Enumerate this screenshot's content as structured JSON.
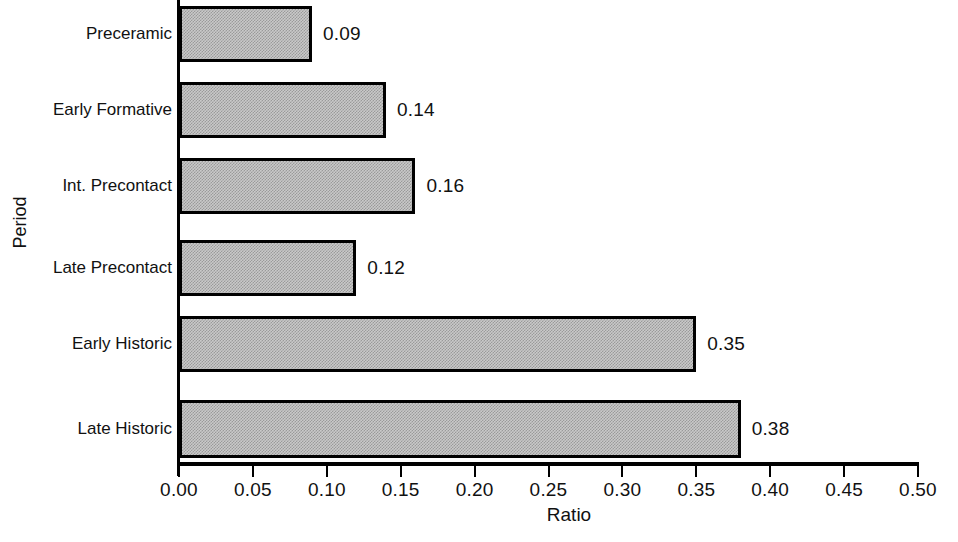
{
  "chart_data": {
    "type": "bar",
    "orientation": "horizontal",
    "title": "",
    "xlabel": "Ratio",
    "ylabel": "Period",
    "categories": [
      "Preceramic",
      "Early Formative",
      "Int. Precontact",
      "Late Precontact",
      "Early Historic",
      "Late Historic"
    ],
    "values": [
      0.09,
      0.14,
      0.16,
      0.12,
      0.35,
      0.38
    ],
    "value_labels": [
      "0.09",
      "0.14",
      "0.16",
      "0.12",
      "0.35",
      "0.38"
    ],
    "xlim": [
      0.0,
      0.5
    ],
    "xticks": [
      0.0,
      0.05,
      0.1,
      0.15,
      0.2,
      0.25,
      0.3,
      0.35,
      0.4,
      0.45,
      0.5
    ],
    "xtick_labels": [
      "0.00",
      "0.05",
      "0.10",
      "0.15",
      "0.20",
      "0.25",
      "0.30",
      "0.35",
      "0.40",
      "0.45",
      "0.50"
    ],
    "grid": false,
    "legend": false,
    "bar_fill_color": "#c9c9c9",
    "bar_edge_color": "#000000",
    "axis_color": "#000000",
    "background_color": "#ffffff"
  },
  "bars": [
    {
      "label": "Preceramic",
      "value_label": "0.09",
      "value": 0.09,
      "top": 6,
      "height": 56
    },
    {
      "label": "Early Formative",
      "value_label": "0.14",
      "value": 0.14,
      "top": 82,
      "height": 56
    },
    {
      "label": "Int. Precontact",
      "value_label": "0.16",
      "value": 0.16,
      "top": 158,
      "height": 56
    },
    {
      "label": "Late Precontact",
      "value_label": "0.12",
      "value": 0.12,
      "top": 240,
      "height": 56
    },
    {
      "label": "Early Historic",
      "value_label": "0.35",
      "value": 0.35,
      "top": 316,
      "height": 56
    },
    {
      "label": "Late Historic",
      "value_label": "0.38",
      "value": 0.38,
      "top": 400,
      "height": 58
    }
  ],
  "xticks": [
    {
      "label": "0.00",
      "value": 0.0
    },
    {
      "label": "0.05",
      "value": 0.05
    },
    {
      "label": "0.10",
      "value": 0.1
    },
    {
      "label": "0.15",
      "value": 0.15
    },
    {
      "label": "0.20",
      "value": 0.2
    },
    {
      "label": "0.25",
      "value": 0.25
    },
    {
      "label": "0.30",
      "value": 0.3
    },
    {
      "label": "0.35",
      "value": 0.35
    },
    {
      "label": "0.40",
      "value": 0.4
    },
    {
      "label": "0.45",
      "value": 0.45
    },
    {
      "label": "0.50",
      "value": 0.5
    }
  ],
  "axis_titles": {
    "x": "Ratio",
    "y": "Period"
  }
}
